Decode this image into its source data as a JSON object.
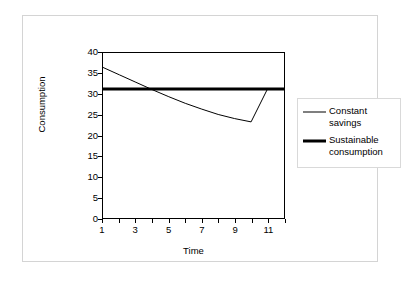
{
  "chart_data": {
    "type": "line",
    "title": "",
    "xlabel": "Time",
    "ylabel": "Consumption",
    "xlim": [
      1,
      12
    ],
    "ylim": [
      0,
      40
    ],
    "grid": false,
    "legend_position": "right",
    "y_ticks": [
      40,
      35,
      30,
      25,
      20,
      15,
      10,
      5,
      0
    ],
    "y_tick_labels": [
      "40",
      "35",
      "30",
      "25",
      "20",
      "15",
      "10",
      "5",
      "0"
    ],
    "x_ticks": [
      1,
      2,
      3,
      4,
      5,
      6,
      7,
      8,
      9,
      10,
      11,
      12
    ],
    "x_tick_labels": [
      "1",
      "",
      "3",
      "",
      "5",
      "",
      "7",
      "",
      "9",
      "",
      "11",
      ""
    ],
    "x": [
      1,
      2,
      3,
      4,
      5,
      6,
      7,
      8,
      9,
      10,
      11,
      12
    ],
    "series": [
      {
        "name": "Constant savings",
        "legend_label": "Constant\nsavings",
        "style": "thin-line",
        "color": "#000000",
        "linewidth": 1,
        "values": [
          36.5,
          34.7,
          32.9,
          31.1,
          29.4,
          27.8,
          26.4,
          25.1,
          24.1,
          23.3,
          31.3,
          null
        ]
      },
      {
        "name": "Sustainable consumption",
        "legend_label": "Sustainable\nconsumption",
        "style": "thick-line",
        "color": "#000000",
        "linewidth": 3,
        "values": [
          31.3,
          31.3,
          31.3,
          31.3,
          31.3,
          31.3,
          31.3,
          31.3,
          31.3,
          31.3,
          31.3,
          31.3
        ]
      }
    ],
    "annotations": []
  },
  "figure": {
    "border_color": "#d4d4d4",
    "background": "#ffffff",
    "axis_color": "#000000"
  }
}
